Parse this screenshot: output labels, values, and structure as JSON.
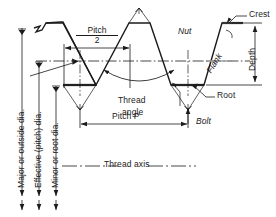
{
  "figure": {
    "type": "engineering-diagram",
    "background_color": "#ffffff",
    "line_color": "#1b1b1b",
    "shade_color": "#808080"
  },
  "labels": {
    "pitch_half_numerator": "Pitch",
    "pitch_half_denominator": "2",
    "pitch_p": "Pitch P",
    "thread_angle_line1": "Thread",
    "thread_angle_line2": "angle",
    "crest": "Crest",
    "root": "Root",
    "depth": "Depth",
    "flank": "Flank",
    "nut": "Nut",
    "bolt": "Bolt",
    "thread_axis": "Thread axis",
    "major_dia": "Major or outside dia.",
    "effective_dia": "Effective (pitch) dia.",
    "minor_dia": "Minor or root dia."
  },
  "geometry": {
    "crest_y": 22,
    "pitch_line_y": 61,
    "root_y": 84,
    "v_apex_y": 105,
    "pitch_p_dim_y": 121,
    "thread_axis_y": 166,
    "left_break_x": 34,
    "right_end_x": 246
  }
}
